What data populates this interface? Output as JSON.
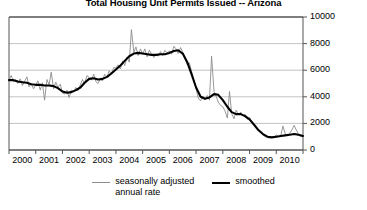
{
  "chart_data": {
    "type": "line",
    "title": "Total Housing Unit Permits Issued -- Arizona",
    "xlabel": "",
    "ylabel": "",
    "xlim": [
      2000,
      2011
    ],
    "ylim": [
      0,
      10000
    ],
    "grid": true,
    "legend_position": "bottom-center",
    "y_ticks": [
      0,
      2000,
      4000,
      6000,
      8000,
      10000
    ],
    "y_tick_labels": [
      "0",
      "2000",
      "4000",
      "6000",
      "8000",
      "10000"
    ],
    "y_axis_side": "right",
    "x_ticks": [
      2000,
      2001,
      2002,
      2003,
      2004,
      2005,
      2006,
      2007,
      2008,
      2009,
      2010
    ],
    "x_tick_labels": [
      "2000",
      "2001",
      "2002",
      "2003",
      "2004",
      "2005",
      "2006",
      "2007",
      "2008",
      "2009",
      "2010"
    ],
    "colors": {
      "seasonally_adjusted": "#8c8c8c",
      "smoothed": "#000000",
      "grid": "#b4b4b4",
      "axis": "#555555"
    },
    "series": [
      {
        "name": "seasonally adjusted annual rate",
        "color": "#8c8c8c",
        "x": [
          2000.0,
          2000.08,
          2000.17,
          2000.25,
          2000.33,
          2000.42,
          2000.5,
          2000.58,
          2000.67,
          2000.75,
          2000.83,
          2000.92,
          2001.0,
          2001.08,
          2001.17,
          2001.25,
          2001.33,
          2001.42,
          2001.5,
          2001.58,
          2001.67,
          2001.75,
          2001.83,
          2001.92,
          2002.0,
          2002.08,
          2002.17,
          2002.25,
          2002.33,
          2002.42,
          2002.5,
          2002.58,
          2002.67,
          2002.75,
          2002.83,
          2002.92,
          2003.0,
          2003.08,
          2003.17,
          2003.25,
          2003.33,
          2003.42,
          2003.5,
          2003.58,
          2003.67,
          2003.75,
          2003.83,
          2003.92,
          2004.0,
          2004.08,
          2004.17,
          2004.25,
          2004.33,
          2004.42,
          2004.5,
          2004.58,
          2004.67,
          2004.75,
          2004.83,
          2004.92,
          2005.0,
          2005.08,
          2005.17,
          2005.25,
          2005.33,
          2005.42,
          2005.5,
          2005.58,
          2005.67,
          2005.75,
          2005.83,
          2005.92,
          2006.0,
          2006.08,
          2006.17,
          2006.25,
          2006.33,
          2006.42,
          2006.5,
          2006.58,
          2006.67,
          2006.75,
          2006.83,
          2006.92,
          2007.0,
          2007.08,
          2007.17,
          2007.25,
          2007.33,
          2007.42,
          2007.5,
          2007.58,
          2007.67,
          2007.75,
          2007.83,
          2007.92,
          2008.0,
          2008.08,
          2008.17,
          2008.25,
          2008.33,
          2008.42,
          2008.5,
          2008.58,
          2008.67,
          2008.75,
          2008.83,
          2008.92,
          2009.0,
          2009.08,
          2009.17,
          2009.25,
          2009.33,
          2009.42,
          2009.5,
          2009.58,
          2009.67,
          2009.75,
          2009.83,
          2009.92,
          2010.0,
          2010.08,
          2010.17,
          2010.25,
          2010.33,
          2010.42,
          2010.5,
          2010.58,
          2010.67,
          2010.75,
          2010.83,
          2010.92,
          2011.0
        ],
        "values": [
          5250,
          5600,
          5150,
          5300,
          5000,
          5350,
          4850,
          5150,
          5500,
          4750,
          5000,
          4600,
          4900,
          5200,
          4500,
          5050,
          3750,
          5300,
          4900,
          5850,
          4600,
          5100,
          4700,
          4950,
          4300,
          4200,
          4500,
          3950,
          4500,
          4350,
          4700,
          4450,
          4900,
          5300,
          5000,
          5600,
          5450,
          5250,
          5700,
          5150,
          5000,
          5350,
          5200,
          5700,
          5500,
          5950,
          5700,
          6200,
          6150,
          6400,
          6100,
          6700,
          6350,
          7000,
          6600,
          9050,
          7350,
          7750,
          7100,
          7600,
          7200,
          7600,
          7000,
          7500,
          7250,
          6950,
          7200,
          7050,
          7400,
          7100,
          7500,
          7300,
          7450,
          7200,
          7800,
          7600,
          7250,
          7700,
          7350,
          6900,
          6400,
          6550,
          5900,
          5200,
          4600,
          3900,
          3700,
          4050,
          3800,
          4100,
          3750,
          7050,
          4400,
          4050,
          3600,
          3350,
          3250,
          2950,
          2400,
          4400,
          2750,
          2350,
          3000,
          2650,
          2850,
          2550,
          2700,
          2300,
          2450,
          2100,
          1900,
          1700,
          1450,
          1300,
          1150,
          1000,
          950,
          900,
          1000,
          950,
          1150,
          1000,
          1100,
          1800,
          1250,
          1100,
          1250,
          1500,
          1850,
          1500,
          1200,
          1000,
          1050
        ]
      },
      {
        "name": "smoothed",
        "color": "#000000",
        "x": [
          2000.0,
          2000.17,
          2000.33,
          2000.5,
          2000.67,
          2000.83,
          2001.0,
          2001.17,
          2001.33,
          2001.5,
          2001.67,
          2001.83,
          2002.0,
          2002.17,
          2002.33,
          2002.5,
          2002.67,
          2002.83,
          2003.0,
          2003.17,
          2003.33,
          2003.5,
          2003.67,
          2003.83,
          2004.0,
          2004.17,
          2004.33,
          2004.5,
          2004.67,
          2004.83,
          2005.0,
          2005.17,
          2005.33,
          2005.5,
          2005.67,
          2005.83,
          2006.0,
          2006.17,
          2006.33,
          2006.5,
          2006.67,
          2006.83,
          2007.0,
          2007.17,
          2007.33,
          2007.5,
          2007.67,
          2007.83,
          2008.0,
          2008.17,
          2008.33,
          2008.5,
          2008.67,
          2008.83,
          2009.0,
          2009.17,
          2009.33,
          2009.5,
          2009.67,
          2009.83,
          2010.0,
          2010.17,
          2010.33,
          2010.5,
          2010.67,
          2010.83,
          2011.0
        ],
        "values": [
          5250,
          5250,
          5150,
          5100,
          5050,
          4950,
          4900,
          4900,
          4850,
          4850,
          4800,
          4650,
          4400,
          4300,
          4350,
          4500,
          4700,
          5050,
          5350,
          5400,
          5300,
          5350,
          5500,
          5750,
          6050,
          6350,
          6700,
          7050,
          7250,
          7300,
          7250,
          7200,
          7150,
          7150,
          7200,
          7200,
          7300,
          7450,
          7500,
          7250,
          6600,
          5700,
          4700,
          4000,
          3850,
          3950,
          4200,
          4150,
          3750,
          3250,
          2850,
          2700,
          2700,
          2550,
          2300,
          1900,
          1500,
          1200,
          1000,
          950,
          1000,
          1050,
          1100,
          1150,
          1200,
          1150,
          1050
        ]
      }
    ]
  },
  "legend": {
    "entries": [
      {
        "label_line1": "seasonally adjusted",
        "label_line2": "annual rate",
        "style": "thin"
      },
      {
        "label_line1": "smoothed",
        "label_line2": "",
        "style": "thick"
      }
    ]
  }
}
